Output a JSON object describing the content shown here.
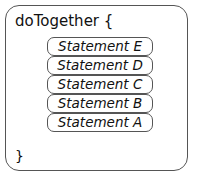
{
  "block": {
    "header": "doTogether {",
    "closing": "}",
    "statements": [
      {
        "label": "Statement E"
      },
      {
        "label": "Statement D"
      },
      {
        "label": "Statement C"
      },
      {
        "label": "Statement B"
      },
      {
        "label": "Statement A"
      }
    ]
  }
}
